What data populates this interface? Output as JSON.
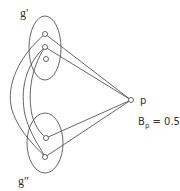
{
  "diagram": {
    "groups": [
      {
        "id": "g1",
        "label": "g′"
      },
      {
        "id": "g2",
        "label": "g″"
      }
    ],
    "node_p": {
      "label": "p"
    },
    "annotation": {
      "base": "B",
      "sub": "p",
      "value": " = 0.5"
    },
    "colors": {
      "stroke": "#555555",
      "text": "#333333"
    }
  }
}
